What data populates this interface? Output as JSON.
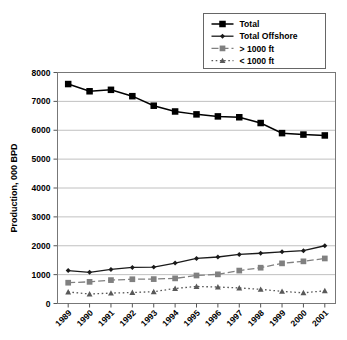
{
  "chart_data": {
    "type": "line",
    "title": "",
    "xlabel": "",
    "ylabel": "Production, 000 BPD",
    "categories": [
      "1989",
      "1990",
      "1991",
      "1992",
      "1993",
      "1994",
      "1995",
      "1996",
      "1997",
      "1998",
      "1999",
      "2000",
      "2001"
    ],
    "ylim": [
      0,
      8000
    ],
    "ytick_labels": [
      "0",
      "1000",
      "2000",
      "3000",
      "4000",
      "5000",
      "6000",
      "7000",
      "8000"
    ],
    "ytick_values": [
      0,
      1000,
      2000,
      3000,
      4000,
      5000,
      6000,
      7000,
      8000
    ],
    "grid": "horizontal",
    "legend_position": "top-right",
    "series": [
      {
        "name": "Total",
        "marker": "square",
        "color": "#000000",
        "linestyle": "solid",
        "values": [
          7600,
          7350,
          7400,
          7180,
          6850,
          6650,
          6550,
          6480,
          6450,
          6250,
          5900,
          5850,
          5820
        ]
      },
      {
        "name": "Total Offshore",
        "marker": "diamond",
        "color": "#1a1a1a",
        "linestyle": "solid",
        "values": [
          1140,
          1080,
          1180,
          1250,
          1260,
          1400,
          1560,
          1610,
          1700,
          1740,
          1790,
          1830,
          2000
        ]
      },
      {
        "name": "> 1000 ft",
        "marker": "square",
        "color": "#808080",
        "linestyle": "dashed",
        "values": [
          720,
          750,
          810,
          840,
          845,
          870,
          970,
          1010,
          1140,
          1240,
          1390,
          1460,
          1560
        ]
      },
      {
        "name": "< 1000 ft",
        "marker": "triangle",
        "color": "#595959",
        "linestyle": "dotted",
        "values": [
          400,
          330,
          360,
          380,
          410,
          520,
          590,
          570,
          540,
          490,
          420,
          370,
          440
        ]
      }
    ]
  }
}
